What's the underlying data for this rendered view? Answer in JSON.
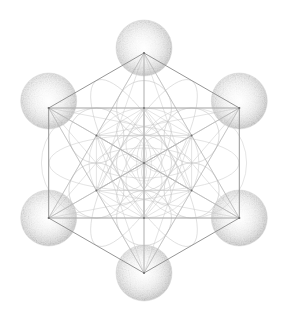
{
  "figure": {
    "type": "sacred-geometry-diagram",
    "canvas": {
      "width": 291,
      "height": 327,
      "background": "#ffffff"
    },
    "colors": {
      "background": "#ffffff",
      "hexagon_stroke": "#8a8a8a",
      "line_stroke": "#b0b0b0",
      "faint_line_stroke": "#c8c8c8",
      "circle_stroke": "#bcbcbc",
      "sphere_fill_center": "#fbfbfb",
      "sphere_fill_edge": "#d2d2d2",
      "sphere_speckle": "#a9a9a9",
      "node_dot": "#6e6e6e"
    },
    "geometry": {
      "center": {
        "x": 144,
        "y": 163
      },
      "inner_ring_radius": 55,
      "outer_ring_radius": 110,
      "sphere_radius": 28,
      "flower_circle_radius": 27.5,
      "small_flower_radius": 18
    },
    "nodes": [
      {
        "name": "center",
        "x": 144,
        "y": 163,
        "ring": "center",
        "sphere": false
      },
      {
        "name": "inner-top",
        "x": 144,
        "y": 108,
        "ring": "inner",
        "sphere": false
      },
      {
        "name": "inner-upper-right",
        "x": 191.6,
        "y": 135.5,
        "ring": "inner",
        "sphere": false
      },
      {
        "name": "inner-lower-right",
        "x": 191.6,
        "y": 190.5,
        "ring": "inner",
        "sphere": false
      },
      {
        "name": "inner-bottom",
        "x": 144,
        "y": 218,
        "ring": "inner",
        "sphere": false
      },
      {
        "name": "inner-lower-left",
        "x": 96.4,
        "y": 190.5,
        "ring": "inner",
        "sphere": false
      },
      {
        "name": "inner-upper-left",
        "x": 96.4,
        "y": 135.5,
        "ring": "inner",
        "sphere": false
      },
      {
        "name": "outer-top",
        "x": 144,
        "y": 53,
        "ring": "outer",
        "sphere": true
      },
      {
        "name": "outer-upper-right",
        "x": 239.3,
        "y": 108,
        "ring": "outer",
        "sphere": true
      },
      {
        "name": "outer-lower-right",
        "x": 239.3,
        "y": 218,
        "ring": "outer",
        "sphere": true
      },
      {
        "name": "outer-bottom",
        "x": 144,
        "y": 273,
        "ring": "outer",
        "sphere": true
      },
      {
        "name": "outer-lower-left",
        "x": 48.7,
        "y": 218,
        "ring": "outer",
        "sphere": true
      },
      {
        "name": "outer-upper-left",
        "x": 48.7,
        "y": 108,
        "ring": "outer",
        "sphere": true
      }
    ],
    "spheres": [
      {
        "name": "sphere-top",
        "cx": 144,
        "cy": 48,
        "r": 28
      },
      {
        "name": "sphere-upper-right",
        "cx": 239.3,
        "cy": 101,
        "r": 28
      },
      {
        "name": "sphere-lower-right",
        "cx": 239.3,
        "cy": 218,
        "r": 28
      },
      {
        "name": "sphere-bottom",
        "cx": 144,
        "cy": 273,
        "r": 28
      },
      {
        "name": "sphere-lower-left",
        "cx": 48.7,
        "cy": 218,
        "r": 28
      },
      {
        "name": "sphere-upper-left",
        "cx": 48.7,
        "cy": 101,
        "r": 28
      }
    ],
    "flower_circles": [
      {
        "name": "flower-circle-center",
        "cx": 144,
        "cy": 163,
        "r": 27.5
      },
      {
        "name": "flower-circle-top",
        "cx": 144,
        "cy": 108,
        "r": 27.5
      },
      {
        "name": "flower-circle-upper-right",
        "cx": 191.6,
        "cy": 135.5,
        "r": 27.5
      },
      {
        "name": "flower-circle-lower-right",
        "cx": 191.6,
        "cy": 190.5,
        "r": 27.5
      },
      {
        "name": "flower-circle-bottom",
        "cx": 144,
        "cy": 218,
        "r": 27.5
      },
      {
        "name": "flower-circle-lower-left",
        "cx": 96.4,
        "cy": 190.5,
        "r": 27.5
      },
      {
        "name": "flower-circle-upper-left",
        "cx": 96.4,
        "cy": 135.5,
        "r": 27.5
      }
    ],
    "small_flower_circles": [
      {
        "name": "small-circle-center",
        "cx": 144,
        "cy": 163,
        "r": 18
      },
      {
        "name": "small-circle-top",
        "cx": 144,
        "cy": 145,
        "r": 18
      },
      {
        "name": "small-circle-upper-right",
        "cx": 159.6,
        "cy": 154,
        "r": 18
      },
      {
        "name": "small-circle-lower-right",
        "cx": 159.6,
        "cy": 172,
        "r": 18
      },
      {
        "name": "small-circle-bottom",
        "cx": 144,
        "cy": 181,
        "r": 18
      },
      {
        "name": "small-circle-lower-left",
        "cx": 128.4,
        "cy": 172,
        "r": 18
      },
      {
        "name": "small-circle-upper-left",
        "cx": 128.4,
        "cy": 154,
        "r": 18
      }
    ],
    "outer_hexagon_path": "M 144,53 L 239.3,108 L 239.3,218 L 144,273 L 48.7,218 L 48.7,108 Z",
    "inner_hexagon_path": "M 144,108 L 191.6,135.5 L 191.6,190.5 L 144,218 L 96.4,190.5 L 96.4,135.5 Z"
  }
}
